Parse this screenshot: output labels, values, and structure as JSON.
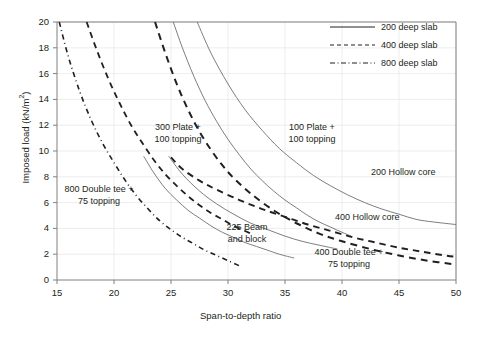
{
  "chart_data": {
    "type": "line",
    "title": "",
    "xlabel": "Span-to-depth ratio",
    "ylabel": "Imposed load (kN/m2)",
    "ylabel_base": "Imposed load (kN/m",
    "ylabel_sup": "2",
    "ylabel_tail": ")",
    "xlim": [
      15,
      50
    ],
    "ylim": [
      0,
      20
    ],
    "xticks": [
      15,
      20,
      25,
      30,
      35,
      40,
      45,
      50
    ],
    "yticks": [
      0,
      2,
      4,
      6,
      8,
      10,
      12,
      14,
      16,
      18,
      20
    ],
    "grid": true,
    "grid_color": "#e8e8e8",
    "axis_color": "#808080",
    "legend_position": "top-right",
    "legend": [
      {
        "label": "200 deep slab",
        "style": "solid"
      },
      {
        "label": "400 deep slab",
        "style": "dashed"
      },
      {
        "label": "800 deep slab",
        "style": "dashdot"
      }
    ],
    "series": [
      {
        "name": "800 Double tee + 75 topping",
        "style": "dashdot",
        "color": "#231f20",
        "width": 1.6,
        "points": [
          [
            15.2,
            20.0
          ],
          [
            16.0,
            17.3
          ],
          [
            17.0,
            14.6
          ],
          [
            18.0,
            12.4
          ],
          [
            19.0,
            10.6
          ],
          [
            20.0,
            9.1
          ],
          [
            21.0,
            7.7
          ],
          [
            22.0,
            6.5
          ],
          [
            23.0,
            5.5
          ],
          [
            24.0,
            4.6
          ],
          [
            25.0,
            3.9
          ],
          [
            26.0,
            3.3
          ],
          [
            27.0,
            2.8
          ],
          [
            28.0,
            2.3
          ],
          [
            29.0,
            1.9
          ],
          [
            30.0,
            1.5
          ],
          [
            31.0,
            1.1
          ]
        ]
      },
      {
        "name": "300 Plate + 100 topping",
        "style": "dashed",
        "color": "#231f20",
        "width": 1.8,
        "points": [
          [
            17.6,
            20.0
          ],
          [
            18.5,
            17.8
          ],
          [
            19.5,
            15.6
          ],
          [
            20.5,
            13.7
          ],
          [
            21.5,
            12.0
          ],
          [
            22.5,
            10.6
          ],
          [
            23.5,
            9.3
          ],
          [
            24.5,
            8.2
          ],
          [
            25.5,
            7.3
          ],
          [
            26.5,
            6.5
          ],
          [
            27.5,
            5.8
          ],
          [
            28.5,
            5.2
          ],
          [
            29.5,
            4.7
          ],
          [
            30.5,
            4.2
          ],
          [
            31.5,
            3.8
          ],
          [
            32.0,
            3.6
          ]
        ]
      },
      {
        "name": "400 Double tee + 75 topping",
        "style": "dashed",
        "color": "#231f20",
        "width": 2.0,
        "points": [
          [
            23.6,
            20.0
          ],
          [
            24.5,
            17.6
          ],
          [
            25.5,
            15.2
          ],
          [
            26.5,
            13.2
          ],
          [
            27.5,
            11.5
          ],
          [
            28.5,
            10.1
          ],
          [
            29.5,
            8.9
          ],
          [
            30.5,
            7.9
          ],
          [
            32.0,
            6.7
          ],
          [
            34.0,
            5.4
          ],
          [
            36.0,
            4.4
          ],
          [
            38.0,
            3.6
          ],
          [
            40.0,
            3.0
          ],
          [
            42.5,
            2.4
          ],
          [
            45.0,
            1.9
          ],
          [
            47.5,
            1.5
          ],
          [
            50.0,
            1.2
          ]
        ]
      },
      {
        "name": "300 Plate + 100 topping (solid pair)",
        "style": "solid",
        "color": "#6d6e71",
        "width": 0.9,
        "points": [
          [
            25.2,
            20.0
          ],
          [
            26.0,
            18.0
          ],
          [
            27.0,
            15.8
          ],
          [
            28.0,
            13.9
          ],
          [
            29.0,
            12.3
          ],
          [
            30.0,
            10.9
          ],
          [
            31.0,
            9.7
          ],
          [
            32.0,
            8.6
          ],
          [
            33.0,
            7.7
          ],
          [
            34.0,
            6.9
          ],
          [
            35.0,
            6.2
          ],
          [
            36.0,
            5.6
          ],
          [
            37.0,
            5.0
          ],
          [
            38.0,
            4.5
          ],
          [
            39.0,
            4.1
          ],
          [
            40.0,
            3.7
          ],
          [
            40.8,
            3.4
          ]
        ]
      },
      {
        "name": "200 Hollow core",
        "style": "solid",
        "color": "#6d6e71",
        "width": 0.9,
        "points": [
          [
            27.3,
            20.0
          ],
          [
            28.5,
            17.6
          ],
          [
            30.0,
            15.2
          ],
          [
            31.5,
            13.2
          ],
          [
            33.0,
            11.6
          ],
          [
            34.5,
            10.2
          ],
          [
            36.0,
            9.1
          ],
          [
            37.5,
            8.1
          ],
          [
            39.0,
            7.3
          ],
          [
            40.5,
            6.6
          ],
          [
            42.0,
            6.0
          ],
          [
            43.5,
            5.5
          ],
          [
            45.0,
            5.1
          ],
          [
            46.5,
            4.7
          ],
          [
            48.0,
            4.5
          ],
          [
            50.0,
            4.3
          ]
        ]
      },
      {
        "name": "225 Beam and block",
        "style": "solid",
        "color": "#6d6e71",
        "width": 0.9,
        "points": [
          [
            22.6,
            9.6
          ],
          [
            23.5,
            8.3
          ],
          [
            24.5,
            7.1
          ],
          [
            25.5,
            6.2
          ],
          [
            26.5,
            5.4
          ],
          [
            27.5,
            4.8
          ],
          [
            28.5,
            4.2
          ],
          [
            29.5,
            3.7
          ],
          [
            30.5,
            3.3
          ],
          [
            31.5,
            2.9
          ],
          [
            32.5,
            2.6
          ],
          [
            33.5,
            2.3
          ],
          [
            34.5,
            2.0
          ],
          [
            35.8,
            1.7
          ]
        ]
      },
      {
        "name": "400 Hollow core",
        "style": "dashed",
        "color": "#231f20",
        "width": 1.9,
        "points": [
          [
            25.0,
            9.5
          ],
          [
            26.0,
            8.6
          ],
          [
            27.5,
            7.7
          ],
          [
            29.0,
            7.0
          ],
          [
            31.0,
            6.2
          ],
          [
            33.0,
            5.5
          ],
          [
            35.0,
            4.9
          ],
          [
            37.0,
            4.3
          ],
          [
            39.0,
            3.8
          ],
          [
            41.0,
            3.3
          ],
          [
            43.0,
            2.9
          ],
          [
            45.0,
            2.5
          ],
          [
            47.0,
            2.2
          ],
          [
            49.0,
            1.9
          ],
          [
            50.0,
            1.8
          ]
        ]
      },
      {
        "name": "400 Hollow core thin",
        "style": "solid",
        "color": "#6d6e71",
        "width": 0.9,
        "points": [
          [
            24.8,
            9.6
          ],
          [
            26.0,
            8.2
          ],
          [
            27.5,
            6.9
          ],
          [
            29.0,
            5.9
          ],
          [
            30.5,
            5.1
          ],
          [
            32.0,
            4.4
          ],
          [
            33.5,
            3.9
          ],
          [
            35.0,
            3.4
          ],
          [
            36.5,
            3.0
          ],
          [
            38.0,
            2.7
          ],
          [
            39.6,
            2.4
          ]
        ]
      }
    ],
    "annotations": [
      {
        "text_line1": "300 Plate +",
        "text_line2": "100 topping"
      },
      {
        "text_line1": "100 Plate +",
        "text_line2": "100 topping"
      },
      {
        "text_line1": "800 Double tee +",
        "text_line2": "75 topping"
      },
      {
        "text_line1": "225 Beam",
        "text_line2": "and block"
      },
      {
        "text_line1": "400 Double tee +",
        "text_line2": "75 topping"
      },
      {
        "text_line1": "200 Hollow core",
        "text_line2": ""
      },
      {
        "text_line1": "400 Hollow core",
        "text_line2": ""
      }
    ]
  }
}
